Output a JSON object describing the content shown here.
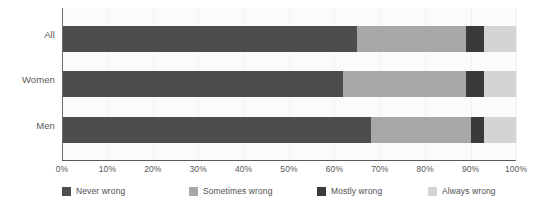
{
  "chart_data": {
    "type": "bar",
    "orientation": "horizontal",
    "stacked": true,
    "stack_mode": "percent",
    "title": "",
    "subtitle": "",
    "xlabel": "",
    "ylabel": "",
    "xlim": [
      0,
      100
    ],
    "grid": true,
    "legend_position": "bottom",
    "categories": [
      "All",
      "Women",
      "Men"
    ],
    "xticks": [
      "0%",
      "10%",
      "20%",
      "30%",
      "40%",
      "50%",
      "60%",
      "70%",
      "80%",
      "90%",
      "100%"
    ],
    "xtick_values": [
      0,
      10,
      20,
      30,
      40,
      50,
      60,
      70,
      80,
      90,
      100
    ],
    "series": [
      {
        "name": "Never wrong",
        "color": "#4d4d4d",
        "values": [
          65,
          62,
          68
        ]
      },
      {
        "name": "Sometimes wrong",
        "color": "#a8a8a8",
        "values": [
          24,
          27,
          22
        ]
      },
      {
        "name": "Mostly wrong",
        "color": "#3a3a3a",
        "values": [
          4,
          4,
          3
        ]
      },
      {
        "name": "Always wrong",
        "color": "#d4d4d4",
        "values": [
          7,
          7,
          7
        ]
      }
    ]
  },
  "colors": {
    "never_wrong": "#4d4d4d",
    "sometimes_wrong": "#a8a8a8",
    "mostly_wrong": "#3a3a3a",
    "always_wrong": "#d4d4d4",
    "plot_background": "#fbfbfb",
    "gridline": "#f1f1f1",
    "axis": "#5a5a5a",
    "text": "#585858"
  }
}
